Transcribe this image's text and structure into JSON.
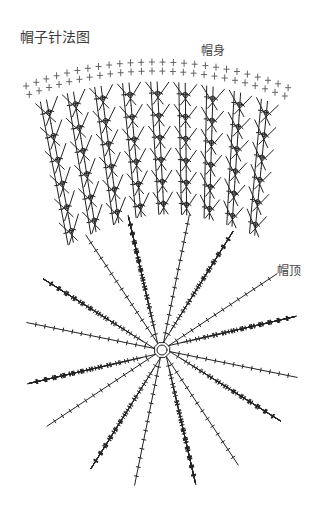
{
  "title": "帽子针法图",
  "labels": {
    "body": "帽身",
    "crown": "帽顶"
  },
  "diagram": {
    "type": "crochet-chart",
    "hat_body": {
      "top_arc": {
        "cx": 155,
        "cy": 420,
        "r": 358,
        "start_x": 23,
        "end_x": 292
      },
      "sc_rows": 2,
      "sc_count": 26,
      "pattern": "crossed-stitch-mesh",
      "mesh_rows": 6,
      "mesh_cols": 9,
      "bottom_left": [
        62,
        248
      ],
      "bottom_right": [
        266,
        240
      ]
    },
    "crown": {
      "center": [
        162,
        350
      ],
      "radius": 138,
      "center_ring_radius": 8,
      "wedges": 8,
      "lines_per_wedge": 7
    },
    "stroke_color": "#222222",
    "background": "#ffffff"
  }
}
